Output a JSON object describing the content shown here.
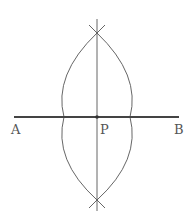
{
  "diagram": {
    "type": "geometric-construction",
    "points": {
      "A": {
        "label": "A"
      },
      "P": {
        "label": "P"
      },
      "B": {
        "label": "B"
      }
    },
    "colors": {
      "segment": "#444444",
      "arcs": "#555555",
      "text": "#555555"
    }
  }
}
